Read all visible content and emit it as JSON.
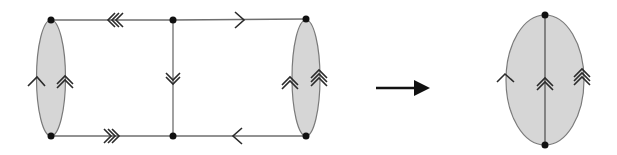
{
  "figure": {
    "description": "Graph contraction: a ladder-shaped graph with two shaded 2-gon faces at each end transforms (arrow) into a single shaded face with three edges",
    "colors": {
      "face_fill": "#d6d6d6",
      "edge": "#6e6e6e",
      "chevron": "#2a2a2a",
      "vertex": "#111111",
      "arrow": "#111111"
    },
    "left_graph": {
      "vertices": [
        {
          "id": "v_tl",
          "x": 51,
          "y": 20
        },
        {
          "id": "v_bl",
          "x": 51,
          "y": 136
        },
        {
          "id": "v_tm",
          "x": 173,
          "y": 20
        },
        {
          "id": "v_bm",
          "x": 173,
          "y": 136
        },
        {
          "id": "v_tr",
          "x": 306,
          "y": 19
        },
        {
          "id": "v_br",
          "x": 306,
          "y": 136
        }
      ],
      "faces": [
        {
          "id": "left-oval",
          "cx": 51,
          "cy": 78,
          "rx": 14.5,
          "ry": 58
        },
        {
          "id": "right-oval",
          "cx": 306,
          "cy": 78,
          "rx": 14,
          "ry": 58
        }
      ],
      "edges": [
        {
          "id": "top-left-edge",
          "from": "v_tl",
          "to": "v_tm",
          "marker": "triple",
          "direction": "left"
        },
        {
          "id": "top-right-edge",
          "from": "v_tm",
          "to": "v_tr",
          "marker": "single",
          "direction": "right"
        },
        {
          "id": "bottom-left-edge",
          "from": "v_bl",
          "to": "v_bm",
          "marker": "triple",
          "direction": "right"
        },
        {
          "id": "bottom-right-edge",
          "from": "v_bm",
          "to": "v_br",
          "marker": "single",
          "direction": "left"
        },
        {
          "id": "middle-vertical-edge",
          "from": "v_tm",
          "to": "v_bm",
          "marker": "double",
          "direction": "down"
        },
        {
          "id": "left-oval-outer-arc",
          "marker": "single",
          "direction": "up"
        },
        {
          "id": "left-oval-inner-arc",
          "marker": "double",
          "direction": "up"
        },
        {
          "id": "right-oval-inner-arc",
          "marker": "double",
          "direction": "up"
        },
        {
          "id": "right-oval-outer-arc",
          "marker": "triple",
          "direction": "up"
        }
      ]
    },
    "transform_arrow": {
      "x1": 376,
      "x2": 430,
      "y": 88,
      "direction": "right"
    },
    "right_graph": {
      "vertices": [
        {
          "id": "w_top",
          "x": 545,
          "y": 15
        },
        {
          "id": "w_bottom",
          "x": 545,
          "y": 145
        }
      ],
      "face": {
        "id": "big-oval",
        "cx": 545,
        "cy": 80,
        "rx": 39,
        "ry": 65
      },
      "edges": [
        {
          "id": "big-oval-left-arc",
          "marker": "single",
          "direction": "up"
        },
        {
          "id": "big-oval-middle-edge",
          "marker": "double",
          "direction": "up"
        },
        {
          "id": "big-oval-right-arc",
          "marker": "triple",
          "direction": "up"
        }
      ]
    }
  }
}
